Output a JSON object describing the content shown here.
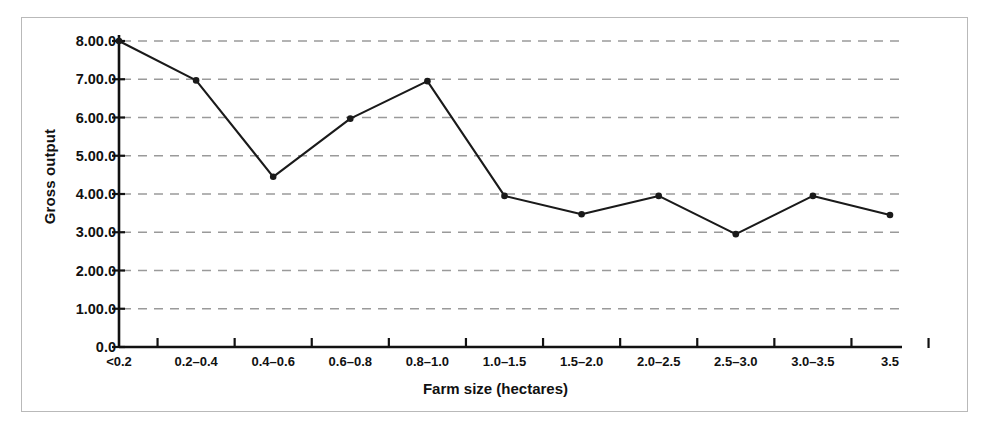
{
  "figure": {
    "frame_border_color": "#b9b9b9",
    "background": "#ffffff",
    "line_color": "#1a1a1a",
    "gridline_color": "#9a9a9a",
    "axis_color": "#111111"
  },
  "chart_data": {
    "type": "line",
    "title": "",
    "xlabel": "Farm size (hectares)",
    "ylabel": "Gross output",
    "categories": [
      "<0.2",
      "0.2–0.4",
      "0.4–0.6",
      "0.6–0.8",
      "0.8–1.0",
      "1.0–1.5",
      "1.5–2.0",
      "2.0–2.5",
      "2.5–3.0",
      "3.0–3.5",
      "3.5"
    ],
    "values": [
      8.0,
      6.97,
      4.45,
      5.97,
      6.95,
      3.95,
      3.47,
      3.95,
      2.95,
      3.95,
      3.45
    ],
    "ytick_labels": [
      "8.00.0",
      "7.00.0",
      "6.00.0",
      "5.00.0",
      "4.00.0",
      "3.00.0",
      "2.00.0",
      "1.00.0",
      "0.0"
    ],
    "ytick_values": [
      8,
      7,
      6,
      5,
      4,
      3,
      2,
      1,
      0
    ],
    "ylim": [
      0,
      8
    ],
    "grid": true,
    "grid_style": "dashed-horizontal",
    "legend": "none",
    "markers": "filled-circle"
  }
}
